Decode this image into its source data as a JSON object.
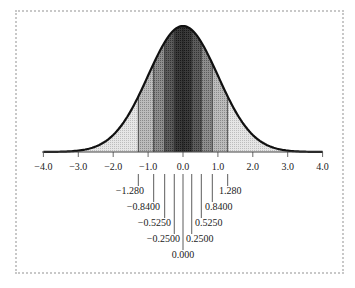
{
  "chart_data": {
    "type": "area",
    "xlabel": "",
    "ylabel": "",
    "xlim": [
      -4.0,
      4.0
    ],
    "x_ticks": [
      "-4.0",
      "-3.0",
      "-2.0",
      "-1.0",
      "0.0",
      "1.0",
      "2.0",
      "3.0",
      "4.0"
    ],
    "boundaries": [
      {
        "value": -1.28,
        "label": "-1.280"
      },
      {
        "value": -0.84,
        "label": "-0.8400"
      },
      {
        "value": -0.525,
        "label": "-0.5250"
      },
      {
        "value": -0.25,
        "label": "-0.2500"
      },
      {
        "value": 0.0,
        "label": "0.000"
      },
      {
        "value": 0.25,
        "label": "0.2500"
      },
      {
        "value": 0.525,
        "label": "0.5250"
      },
      {
        "value": 0.84,
        "label": "0.8400"
      },
      {
        "value": 1.28,
        "label": "1.280"
      }
    ],
    "curve": "standard normal pdf",
    "grid": false,
    "legend": null
  },
  "labels": {
    "ticks": [
      "−4.0",
      "−3.0",
      "−2.0",
      "−1.0",
      "0.0",
      "1.0",
      "2.0",
      "3.0",
      "4.0"
    ],
    "b_neg128": "−1.280",
    "b_neg084": "−0.8400",
    "b_neg0525": "−0.5250",
    "b_neg025": "−0.2500",
    "b_0": "0.000",
    "b_025": "0.2500",
    "b_0525": "0.5250",
    "b_084": "0.8400",
    "b_128": "1.280"
  }
}
